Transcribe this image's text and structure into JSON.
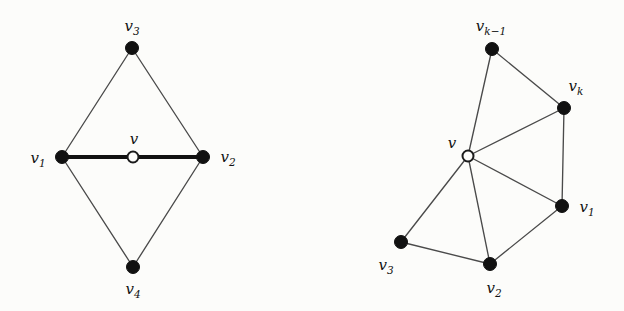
{
  "figure": {
    "background_color": "#fcfcfa",
    "node_fill_color": "#111111",
    "node_open_fill_color": "#fcfcfa",
    "edge_color": "#4a4a4a",
    "highlight_edge_color": "#111111"
  },
  "diagrams": [
    {
      "id": "left-diagram",
      "name": "diamond-graph",
      "nodes": [
        {
          "id": "v",
          "label": "v",
          "sub": "",
          "style": "open",
          "x": 133,
          "y": 157,
          "r": 5.5,
          "label_x": 134,
          "label_y": 139
        },
        {
          "id": "v1",
          "label": "v",
          "sub": "1",
          "style": "filled",
          "x": 62,
          "y": 157,
          "r": 6.5,
          "label_x": 38,
          "label_y": 158
        },
        {
          "id": "v2",
          "label": "v",
          "sub": "2",
          "style": "filled",
          "x": 203,
          "y": 157,
          "r": 6.5,
          "label_x": 228,
          "label_y": 157
        },
        {
          "id": "v3",
          "label": "v",
          "sub": "3",
          "style": "filled",
          "x": 132,
          "y": 48,
          "r": 6.5,
          "label_x": 132,
          "label_y": 26
        },
        {
          "id": "v4",
          "label": "v",
          "sub": "4",
          "style": "filled",
          "x": 133,
          "y": 267,
          "r": 6.5,
          "label_x": 133,
          "label_y": 289
        }
      ],
      "edges": [
        {
          "from": "v1",
          "to": "v",
          "kind": "thick"
        },
        {
          "from": "v",
          "to": "v2",
          "kind": "thick"
        },
        {
          "from": "v1",
          "to": "v3",
          "kind": "thin"
        },
        {
          "from": "v3",
          "to": "v2",
          "kind": "thin"
        },
        {
          "from": "v1",
          "to": "v4",
          "kind": "thin"
        },
        {
          "from": "v4",
          "to": "v2",
          "kind": "thin"
        }
      ]
    },
    {
      "id": "right-diagram",
      "name": "fan-graph",
      "nodes": [
        {
          "id": "v",
          "label": "v",
          "sub": "",
          "style": "open",
          "x": 468,
          "y": 156,
          "r": 5.5,
          "label_x": 452,
          "label_y": 143
        },
        {
          "id": "vk1",
          "label": "v",
          "sub": "k−1",
          "style": "filled",
          "x": 492,
          "y": 49,
          "r": 6.5,
          "label_x": 491,
          "label_y": 26
        },
        {
          "id": "vk",
          "label": "v",
          "sub": "k",
          "style": "filled",
          "x": 564,
          "y": 108,
          "r": 6.5,
          "label_x": 576,
          "label_y": 86
        },
        {
          "id": "v1",
          "label": "v",
          "sub": "1",
          "style": "filled",
          "x": 562,
          "y": 206,
          "r": 6.5,
          "label_x": 587,
          "label_y": 207
        },
        {
          "id": "v2",
          "label": "v",
          "sub": "2",
          "style": "filled",
          "x": 490,
          "y": 264,
          "r": 6.5,
          "label_x": 494,
          "label_y": 288
        },
        {
          "id": "v3",
          "label": "v",
          "sub": "3",
          "style": "filled",
          "x": 401,
          "y": 242,
          "r": 6.5,
          "label_x": 386,
          "label_y": 265
        }
      ],
      "edges": [
        {
          "from": "v",
          "to": "vk1",
          "kind": "thin"
        },
        {
          "from": "v",
          "to": "vk",
          "kind": "thin"
        },
        {
          "from": "v",
          "to": "v1",
          "kind": "thin"
        },
        {
          "from": "v",
          "to": "v2",
          "kind": "thin"
        },
        {
          "from": "v",
          "to": "v3",
          "kind": "thin"
        },
        {
          "from": "vk1",
          "to": "vk",
          "kind": "thin"
        },
        {
          "from": "vk",
          "to": "v1",
          "kind": "thin"
        },
        {
          "from": "v1",
          "to": "v2",
          "kind": "thin"
        },
        {
          "from": "v2",
          "to": "v3",
          "kind": "thin"
        }
      ]
    }
  ]
}
